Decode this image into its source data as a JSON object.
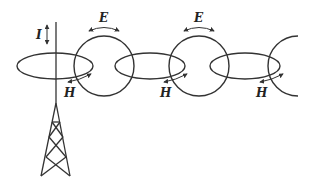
{
  "diagram": {
    "title": "",
    "labels": {
      "current": "I",
      "electric_field": "E",
      "magnetic_field": "H"
    },
    "e_labels": [
      "E",
      "E"
    ],
    "h_labels": [
      "H",
      "H",
      "H"
    ],
    "elements": [
      {
        "type": "antenna-tower",
        "label": "antenna"
      },
      {
        "type": "ellipse",
        "role": "magnetic-loop",
        "label": "H"
      },
      {
        "type": "circle",
        "role": "electric-loop",
        "label": "E"
      },
      {
        "type": "ellipse",
        "role": "magnetic-loop",
        "label": "H"
      },
      {
        "type": "circle",
        "role": "electric-loop",
        "label": "E"
      },
      {
        "type": "ellipse",
        "role": "magnetic-loop",
        "label": "H"
      },
      {
        "type": "arc",
        "role": "electric-loop-partial"
      }
    ],
    "colors": {
      "stroke": "#333333",
      "background": "#ffffff"
    }
  }
}
